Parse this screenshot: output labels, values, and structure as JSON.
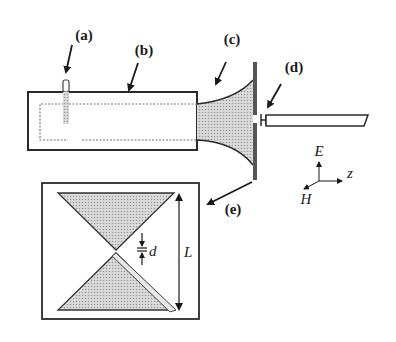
{
  "diagram": {
    "labels": {
      "a": "(a)",
      "b": "(b)",
      "c": "(c)",
      "d": "(d)",
      "e": "(e)"
    },
    "dimensions": {
      "gap": "d",
      "length": "L"
    },
    "axes": {
      "e_field": "E",
      "h_field": "H",
      "propagation": "z"
    },
    "colors": {
      "line": "#2a2a2a",
      "fill": "#bdbdbd",
      "fill_light": "#d8d8d8",
      "background": "#ffffff"
    }
  }
}
